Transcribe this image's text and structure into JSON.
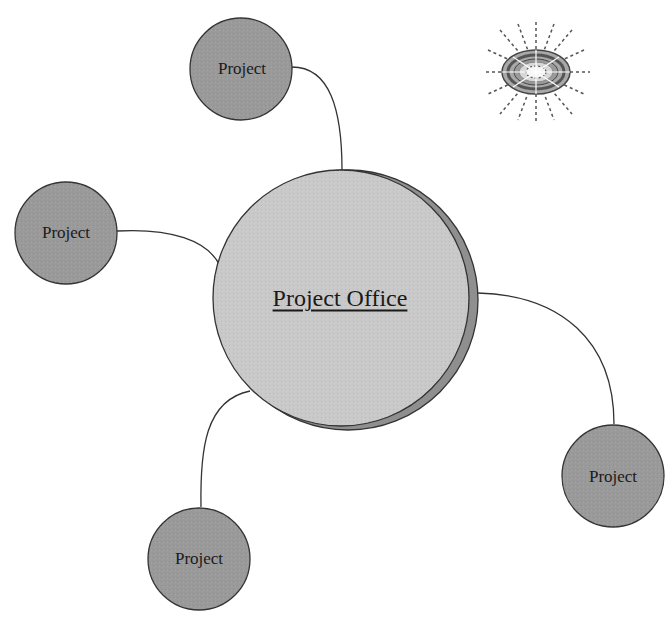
{
  "diagram": {
    "center_node": {
      "label": "Project Office",
      "fill": "#c9c9c9",
      "shadow": "#8f8f8f"
    },
    "satellite_nodes": [
      {
        "label": "Project",
        "position": "top"
      },
      {
        "label": "Project",
        "position": "left"
      },
      {
        "label": "Project",
        "position": "bottom-left"
      },
      {
        "label": "Project",
        "position": "right"
      }
    ],
    "satellite_fill": "#9a9a9a",
    "icon": "radiating-target-icon"
  }
}
